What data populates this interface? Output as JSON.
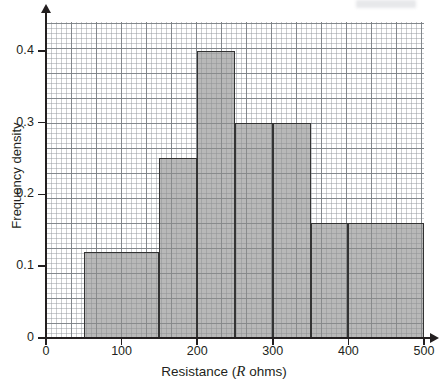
{
  "chart_data": {
    "type": "bar",
    "title": "",
    "subtitle": "",
    "xlabel": "Resistance (R ohms)",
    "xlabel_plain": "Resistance (",
    "xlabel_italic": "R",
    "xlabel_tail": " ohms)",
    "ylabel": "Frequency density",
    "xlim": [
      0,
      500
    ],
    "ylim": [
      0,
      0.44
    ],
    "grid": true,
    "grid_style": "graph-paper, minor every 10 ohms, major every 50 ohms",
    "legend": "none",
    "bar_fill_color": "#8c8c8c",
    "bar_edge_color": "#333333",
    "axis_color": "#231f20",
    "xticks": [
      0,
      100,
      200,
      300,
      400,
      500
    ],
    "xtick_labels": [
      "0",
      "100",
      "200",
      "300",
      "400",
      "500"
    ],
    "yticks": [
      0,
      0.1,
      0.2,
      0.3,
      0.4
    ],
    "ytick_labels": [
      "0",
      "0.1",
      "0.2",
      "0.3",
      "0.4"
    ],
    "bin_edges": [
      50,
      150,
      200,
      250,
      300,
      350,
      400,
      500
    ],
    "values": [
      0.12,
      0.25,
      0.4,
      0.3,
      0.3,
      0.16,
      0.16
    ],
    "bars": [
      {
        "label": "50-150",
        "x0": 50,
        "x1": 150,
        "value": 0.12
      },
      {
        "label": "150-200",
        "x0": 150,
        "x1": 200,
        "value": 0.25
      },
      {
        "label": "200-250",
        "x0": 200,
        "x1": 250,
        "value": 0.4
      },
      {
        "label": "250-300",
        "x0": 250,
        "x1": 300,
        "value": 0.3
      },
      {
        "label": "300-350",
        "x0": 300,
        "x1": 350,
        "value": 0.3
      },
      {
        "label": "350-400",
        "x0": 350,
        "x1": 400,
        "value": 0.16
      },
      {
        "label": "400-500",
        "x0": 400,
        "x1": 500,
        "value": 0.16
      }
    ]
  }
}
